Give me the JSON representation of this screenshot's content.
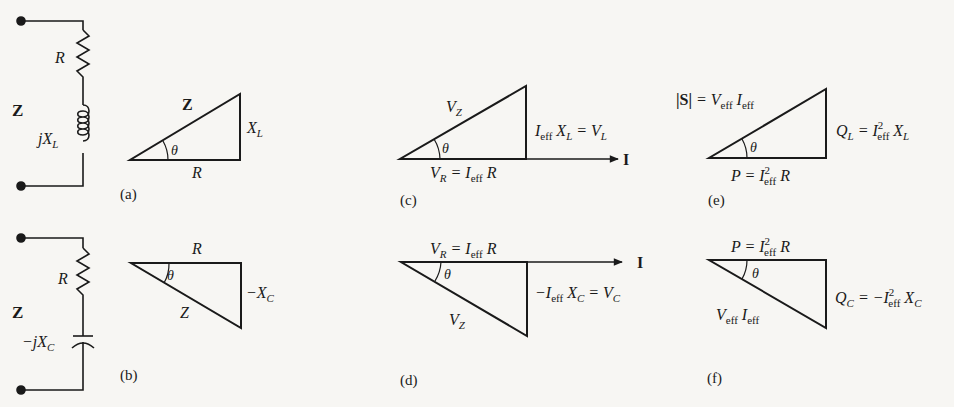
{
  "colors": {
    "background": "#f7f6f3",
    "ink": "#1a1a1a"
  },
  "circuits": {
    "a": {
      "terminal_label": "Z",
      "resistor_label": "R",
      "inductor_label": "jX",
      "inductor_sub": "L"
    },
    "b": {
      "terminal_label": "Z",
      "resistor_label": "R",
      "capacitor_label": "−jX",
      "capacitor_sub": "C"
    }
  },
  "panels": {
    "a": {
      "caption": "(a)",
      "hyp": "Z",
      "base": "R",
      "vert": "X",
      "vert_sub": "L",
      "angle": "θ"
    },
    "b": {
      "caption": "(b)",
      "hyp": "Z",
      "base": "R",
      "vert": "−X",
      "vert_sub": "C",
      "angle": "θ"
    },
    "c": {
      "caption": "(c)",
      "hyp": "V",
      "hyp_sub": "Z",
      "base": "V",
      "base_sub": "R",
      "base_eq": " = I",
      "base_eq_sub": "eff",
      "base_tail": " R",
      "vert_a": "I",
      "vert_a_sub": "eff",
      "vert_b": " X",
      "vert_b_sub": "L",
      "vert_c": " = V",
      "vert_c_sub": "L",
      "arrow": "I",
      "angle": "θ"
    },
    "d": {
      "caption": "(d)",
      "hyp": "V",
      "hyp_sub": "Z",
      "base": "V",
      "base_sub": "R",
      "base_eq": " = I",
      "base_eq_sub": "eff",
      "base_tail": " R",
      "vert_a": "−I",
      "vert_a_sub": "eff",
      "vert_b": " X",
      "vert_b_sub": "C",
      "vert_c": " = V",
      "vert_c_sub": "C",
      "arrow": "I",
      "angle": "θ"
    },
    "e": {
      "caption": "(e)",
      "hyp_s": "|S|",
      "hyp_eq": " = V",
      "hyp_sub1": "eff",
      "hyp_i": " I",
      "hyp_sub2": "eff",
      "base": "P = I",
      "base_sup": "2",
      "base_sub": "eff",
      "base_tail": " R",
      "vert": "Q",
      "vert_sub": "L",
      "vert_eq": " = I",
      "vert_sup": "2",
      "vert_sub2": "eff",
      "vert_tail": " X",
      "vert_tail_sub": "L",
      "angle": "θ"
    },
    "f": {
      "caption": "(f)",
      "hyp": "V",
      "hyp_sub1": "eff",
      "hyp_i": " I",
      "hyp_sub2": "eff",
      "base": "P = I",
      "base_sup": "2",
      "base_sub": "eff",
      "base_tail": " R",
      "vert": "Q",
      "vert_sub": "C",
      "vert_eq": " = −I",
      "vert_sup": "2",
      "vert_sub2": "eff",
      "vert_tail": " X",
      "vert_tail_sub": "C",
      "angle": "θ"
    }
  }
}
